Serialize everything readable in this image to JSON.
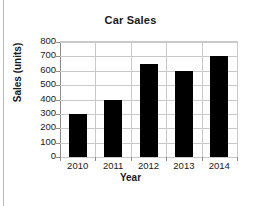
{
  "chart_data": {
    "type": "bar",
    "title": "Car Sales",
    "xlabel": "Year",
    "ylabel": "Sales (units)",
    "categories": [
      "2010",
      "2011",
      "2012",
      "2013",
      "2014"
    ],
    "values": [
      300,
      400,
      650,
      600,
      700
    ],
    "series": [
      {
        "name": "Sales (units)",
        "values": [
          300,
          400,
          650,
          600,
          700
        ]
      }
    ],
    "ylim": [
      0,
      800
    ],
    "ytick_step": 100,
    "yticks": [
      800,
      700,
      600,
      500,
      400,
      300,
      200,
      100,
      0
    ],
    "ytick_labels": [
      "800",
      "700",
      "600",
      "500",
      "400",
      "300",
      "200",
      "100",
      "0"
    ],
    "grid": "both",
    "legend": "none",
    "bar_color": "#000000",
    "grid_color": "#c9c9c9",
    "axis_color": "#8d8d8d",
    "background": "#ffffff",
    "text_color": "#1a1a1a"
  }
}
